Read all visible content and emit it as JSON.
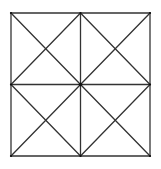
{
  "diagram": {
    "canvas": {
      "width": 161,
      "height": 169
    },
    "outer_square": {
      "x1": 11,
      "y1": 13,
      "x2": 150,
      "y2": 156
    },
    "center": {
      "x": 80.5,
      "y": 84.5
    },
    "stroke_color": "#333333",
    "stroke_width": 1.3,
    "vertex_color": "#111111",
    "sub_squares": [
      {
        "name": "top-left",
        "x1": 11,
        "y1": 13,
        "x2": 80.5,
        "y2": 84.5
      },
      {
        "name": "top-right",
        "x1": 80.5,
        "y1": 13,
        "x2": 150,
        "y2": 84.5
      },
      {
        "name": "bottom-left",
        "x1": 11,
        "y1": 84.5,
        "x2": 80.5,
        "y2": 156
      },
      {
        "name": "bottom-right",
        "x1": 80.5,
        "y1": 84.5,
        "x2": 150,
        "y2": 156
      }
    ]
  }
}
